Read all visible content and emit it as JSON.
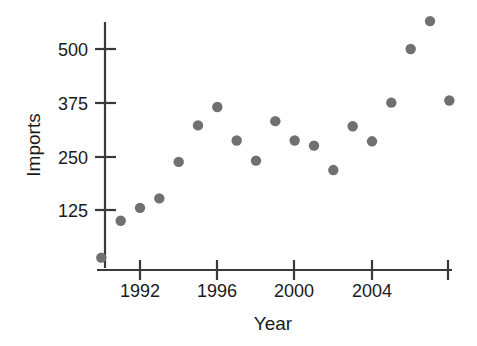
{
  "chart_data": {
    "type": "scatter",
    "title": "",
    "xlabel": "Year",
    "ylabel": "Imports",
    "x": [
      1990,
      1991,
      1992,
      1993,
      1994,
      1995,
      1996,
      1997,
      1998,
      1999,
      2000,
      2001,
      2002,
      2003,
      2004,
      2005,
      2006,
      2007,
      2008
    ],
    "values": [
      14,
      100,
      130,
      152,
      237,
      322,
      365,
      287,
      240,
      332,
      287,
      275,
      218,
      320,
      285,
      375,
      500,
      565,
      380
    ],
    "xlim": [
      1989.4,
      2008.9
    ],
    "ylim": [
      0,
      610
    ],
    "xticks": [
      1992,
      1996,
      2000,
      2004,
      2008
    ],
    "xtick_labels": [
      "1992",
      "1996",
      "2000",
      "2004",
      ""
    ],
    "yticks": [
      125,
      250,
      375,
      500
    ],
    "ytick_labels": [
      "125",
      "250",
      "375",
      "500"
    ],
    "grid": false,
    "legend": false,
    "marker_color": "#707070",
    "axis_color": "#3a3a3a",
    "marker_size": 5.2
  },
  "axes": {
    "y_title": "Imports",
    "x_title": "Year"
  }
}
